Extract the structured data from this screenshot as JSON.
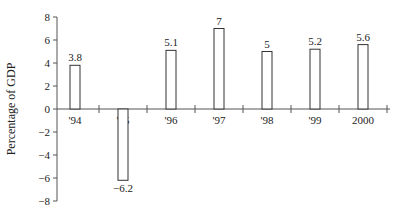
{
  "chart_data": {
    "type": "bar",
    "title": "",
    "xlabel": "",
    "ylabel": "Percentage of GDP",
    "categories": [
      "'94",
      "'95",
      "'96",
      "'97",
      "'98",
      "'99",
      "2000"
    ],
    "values": [
      3.8,
      -6.2,
      5.1,
      7,
      5,
      5.2,
      5.6
    ],
    "data_labels": [
      "3.8",
      "−6.2",
      "5.1",
      "7",
      "5",
      "5.2",
      "5.6"
    ],
    "ylim": [
      -8,
      8
    ],
    "yticks": [
      8,
      6,
      4,
      2,
      0,
      -2,
      -4,
      -6,
      -8
    ],
    "ytick_labels": [
      "8",
      "6",
      "4",
      "2",
      "0",
      "−2",
      "−4",
      "−6",
      "−8"
    ],
    "grid": false,
    "legend": null,
    "bar_fill": "#ffffff",
    "bar_stroke": "#333333"
  }
}
